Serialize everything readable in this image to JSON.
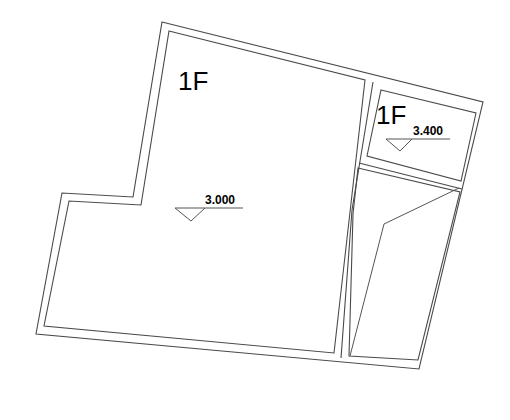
{
  "diagram": {
    "type": "floor-plan",
    "rooms": [
      {
        "id": "main",
        "floor_label": "1F",
        "level_mark": "3.000"
      },
      {
        "id": "small",
        "floor_label": "1F",
        "level_mark": "3.400"
      },
      {
        "id": "lower-right",
        "floor_label": "",
        "level_mark": ""
      }
    ],
    "colors": {
      "background": "#ffffff",
      "lines": "#4a4a4a",
      "text": "#000000"
    }
  }
}
